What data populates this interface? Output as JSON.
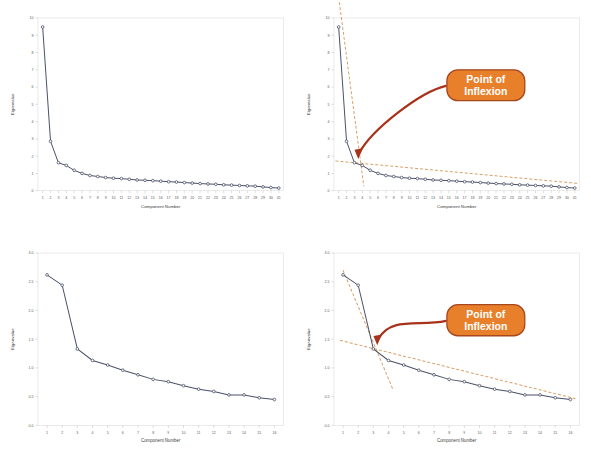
{
  "figure": {
    "type": "scree-plot-grid",
    "rows": 2,
    "columns": 2,
    "background_color": "#ffffff"
  },
  "style": {
    "series_line_color": "#4a5068",
    "series_marker_fill": "#ffffff",
    "series_marker_stroke": "#4a5068",
    "trendline_color": "#d9a066",
    "trendline_dash": "3 2",
    "arrow_color": "#a8331a",
    "callout_fill": "#e8802b",
    "callout_stroke": "#a8461c",
    "callout_text_color": "#ffffff",
    "axis_color": "#c8c8c8",
    "tick_label_color": "#5a5a5a",
    "axis_title_color": "#3c3c3c",
    "panel_border_color": "#dcdcdc"
  },
  "callout": {
    "line1": "Point of",
    "line2": "Inflexion",
    "full_text": "Point of Inflexion"
  },
  "chart_data": [
    {
      "id": "top-left",
      "type": "line",
      "title": "",
      "xlabel": "Component Number",
      "ylabel": "Eigenvalue",
      "xlim": [
        0.4,
        31.6
      ],
      "ylim": [
        0,
        10
      ],
      "ytick_labels": [
        "0",
        "1",
        "2",
        "3",
        "4",
        "5",
        "6",
        "7",
        "8",
        "9",
        "10"
      ],
      "yticks": [
        0,
        1,
        2,
        3,
        4,
        5,
        6,
        7,
        8,
        9,
        10
      ],
      "xtick_labels": [
        "1",
        "2",
        "3",
        "4",
        "5",
        "6",
        "7",
        "8",
        "9",
        "10",
        "11",
        "12",
        "13",
        "14",
        "15",
        "16",
        "17",
        "18",
        "19",
        "20",
        "21",
        "22",
        "23",
        "24",
        "25",
        "26",
        "27",
        "28",
        "29",
        "30",
        "31"
      ],
      "grid": false,
      "legend": "none",
      "annotations": [],
      "x": [
        1,
        2,
        3,
        4,
        5,
        6,
        7,
        8,
        9,
        10,
        11,
        12,
        13,
        14,
        15,
        16,
        17,
        18,
        19,
        20,
        21,
        22,
        23,
        24,
        25,
        26,
        27,
        28,
        29,
        30,
        31
      ],
      "values": [
        9.48,
        2.86,
        1.62,
        1.46,
        1.18,
        1.0,
        0.88,
        0.82,
        0.76,
        0.72,
        0.7,
        0.66,
        0.62,
        0.6,
        0.58,
        0.55,
        0.52,
        0.5,
        0.47,
        0.44,
        0.41,
        0.39,
        0.37,
        0.34,
        0.32,
        0.3,
        0.28,
        0.26,
        0.22,
        0.18,
        0.15
      ]
    },
    {
      "id": "top-right",
      "type": "line",
      "title": "",
      "xlabel": "Component Number",
      "ylabel": "Eigenvalue",
      "xlim": [
        0.4,
        31.6
      ],
      "ylim": [
        0,
        10
      ],
      "ytick_labels": [
        "0",
        "1",
        "2",
        "3",
        "4",
        "5",
        "6",
        "7",
        "8",
        "9",
        "10"
      ],
      "yticks": [
        0,
        1,
        2,
        3,
        4,
        5,
        6,
        7,
        8,
        9,
        10
      ],
      "xtick_labels": [
        "1",
        "2",
        "3",
        "4",
        "5",
        "6",
        "7",
        "8",
        "9",
        "10",
        "11",
        "12",
        "13",
        "14",
        "15",
        "16",
        "17",
        "18",
        "19",
        "20",
        "21",
        "22",
        "23",
        "24",
        "25",
        "26",
        "27",
        "28",
        "29",
        "30",
        "31"
      ],
      "grid": false,
      "legend": "none",
      "x": [
        1,
        2,
        3,
        4,
        5,
        6,
        7,
        8,
        9,
        10,
        11,
        12,
        13,
        14,
        15,
        16,
        17,
        18,
        19,
        20,
        21,
        22,
        23,
        24,
        25,
        26,
        27,
        28,
        29,
        30,
        31
      ],
      "values": [
        9.48,
        2.86,
        1.62,
        1.46,
        1.18,
        1.0,
        0.88,
        0.82,
        0.76,
        0.72,
        0.7,
        0.66,
        0.62,
        0.6,
        0.58,
        0.55,
        0.52,
        0.5,
        0.47,
        0.44,
        0.41,
        0.39,
        0.37,
        0.34,
        0.32,
        0.3,
        0.28,
        0.26,
        0.22,
        0.18,
        0.15
      ],
      "trendlines": [
        {
          "name": "steep-segment",
          "x": [
            1.0,
            4.2
          ],
          "y": [
            11.2,
            0.25
          ]
        },
        {
          "name": "shallow-segment",
          "x": [
            0.6,
            31.4
          ],
          "y": [
            1.72,
            0.42
          ]
        }
      ],
      "annotations": [
        {
          "label": "Point of Inflexion",
          "x": 3,
          "y": 1.62
        }
      ]
    },
    {
      "id": "bottom-left",
      "type": "line",
      "title": "",
      "xlabel": "Component Number",
      "ylabel": "Eigenvalue",
      "xlim": [
        0.4,
        16.6
      ],
      "ylim": [
        0.0,
        3.0
      ],
      "ytick_labels": [
        "0.0",
        "0.5",
        "1.0",
        "1.5",
        "2.0",
        "2.5",
        "3.0"
      ],
      "yticks": [
        0.0,
        0.5,
        1.0,
        1.5,
        2.0,
        2.5,
        3.0
      ],
      "xtick_labels": [
        "1",
        "2",
        "3",
        "4",
        "5",
        "6",
        "7",
        "8",
        "9",
        "10",
        "11",
        "12",
        "13",
        "14",
        "15",
        "16"
      ],
      "grid": false,
      "legend": "none",
      "annotations": [],
      "x": [
        1,
        2,
        3,
        4,
        5,
        6,
        7,
        8,
        9,
        10,
        11,
        12,
        13,
        14,
        15,
        16
      ],
      "values": [
        2.62,
        2.44,
        1.33,
        1.13,
        1.05,
        0.96,
        0.88,
        0.8,
        0.76,
        0.69,
        0.63,
        0.59,
        0.53,
        0.53,
        0.48,
        0.45
      ]
    },
    {
      "id": "bottom-right",
      "type": "line",
      "title": "",
      "xlabel": "Component Number",
      "ylabel": "Eigenvalue",
      "xlim": [
        0.4,
        16.6
      ],
      "ylim": [
        0.0,
        3.0
      ],
      "ytick_labels": [
        "0.0",
        "0.5",
        "1.0",
        "1.5",
        "2.0",
        "2.5",
        "3.0"
      ],
      "yticks": [
        0.0,
        0.5,
        1.0,
        1.5,
        2.0,
        2.5,
        3.0
      ],
      "xtick_labels": [
        "1",
        "2",
        "3",
        "4",
        "5",
        "6",
        "7",
        "8",
        "9",
        "10",
        "11",
        "12",
        "13",
        "14",
        "15",
        "16"
      ],
      "grid": false,
      "legend": "none",
      "x": [
        1,
        2,
        3,
        4,
        5,
        6,
        7,
        8,
        9,
        10,
        11,
        12,
        13,
        14,
        15,
        16
      ],
      "values": [
        2.62,
        2.44,
        1.33,
        1.13,
        1.05,
        0.96,
        0.88,
        0.8,
        0.76,
        0.69,
        0.63,
        0.59,
        0.53,
        0.53,
        0.48,
        0.45
      ],
      "trendlines": [
        {
          "name": "steep-segment",
          "x": [
            1.0,
            4.3
          ],
          "y": [
            2.7,
            0.62
          ]
        },
        {
          "name": "shallow-segment",
          "x": [
            0.8,
            16.4
          ],
          "y": [
            1.48,
            0.46
          ]
        }
      ],
      "annotations": [
        {
          "label": "Point of Inflexion",
          "x": 3,
          "y": 1.33
        }
      ]
    }
  ]
}
